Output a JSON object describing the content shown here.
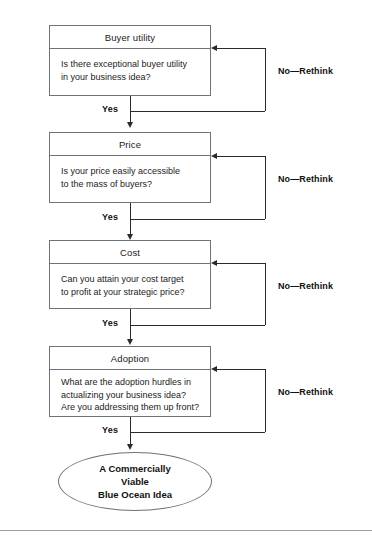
{
  "diagram": {
    "type": "flowchart",
    "nodes": [
      {
        "id": "buyer-utility",
        "header": "Buyer utility",
        "lines": [
          "Is there exceptional buyer utility",
          "in your business idea?"
        ],
        "yes_label": "Yes",
        "no_label": "No—Rethink"
      },
      {
        "id": "price",
        "header": "Price",
        "lines": [
          "Is your price easily accessible",
          "to the mass of buyers?"
        ],
        "yes_label": "Yes",
        "no_label": "No—Rethink"
      },
      {
        "id": "cost",
        "header": "Cost",
        "lines": [
          "Can you attain your cost target",
          "to profit at your strategic price?"
        ],
        "yes_label": "Yes",
        "no_label": "No—Rethink"
      },
      {
        "id": "adoption",
        "header": "Adoption",
        "lines": [
          "What are the adoption hurdles in",
          "actualizing your business idea?",
          "Are you addressing them up front?"
        ],
        "yes_label": "Yes",
        "no_label": "No—Rethink"
      }
    ],
    "terminal": {
      "id": "blue-ocean-idea",
      "lines": [
        "A Commercially",
        "Viable",
        "Blue Ocean Idea"
      ]
    },
    "colors": {
      "box_border": "#6f7276",
      "connector": "#2a2a2a",
      "text": "#1b1b1b",
      "rule": "#9a9ca0",
      "background": "#ffffff"
    }
  }
}
